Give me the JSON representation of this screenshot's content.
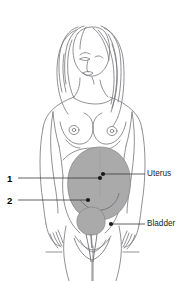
{
  "page": {
    "width": 187,
    "height": 281,
    "background_color": "#FFFFFF",
    "header_text": "LONGITUDINAL SECTION"
  },
  "diagram": {
    "figure_type": "anatomical-line-drawing",
    "outline_color": "#6E6E74",
    "organ_fill_color": "#AAAAAA",
    "organ_stroke_color": "#7A7A80",
    "leader_line_color": "#3A3A3A",
    "marker_color": "#1A1A1A"
  },
  "labels": {
    "right": [
      {
        "id": "uterus",
        "text": "Uterus",
        "marker_x": 103,
        "marker_y": 174,
        "leader_y": 174
      },
      {
        "id": "bladder",
        "text": "Bladder",
        "marker_x": 111,
        "marker_y": 224,
        "leader_y": 224
      }
    ],
    "left": [
      {
        "id": "one",
        "text": "1",
        "marker_x": 100,
        "marker_y": 178,
        "leader_y": 178
      },
      {
        "id": "two",
        "text": "2",
        "marker_x": 88,
        "marker_y": 200,
        "leader_y": 200
      }
    ]
  },
  "organs": {
    "uterus": {
      "name": "Uterus",
      "center_x": 100,
      "center_y": 185,
      "radius_x": 32,
      "radius_y": 38
    },
    "bladder": {
      "name": "Bladder",
      "center_x": 91,
      "center_y": 221,
      "radius_x": 15,
      "radius_y": 14
    }
  }
}
